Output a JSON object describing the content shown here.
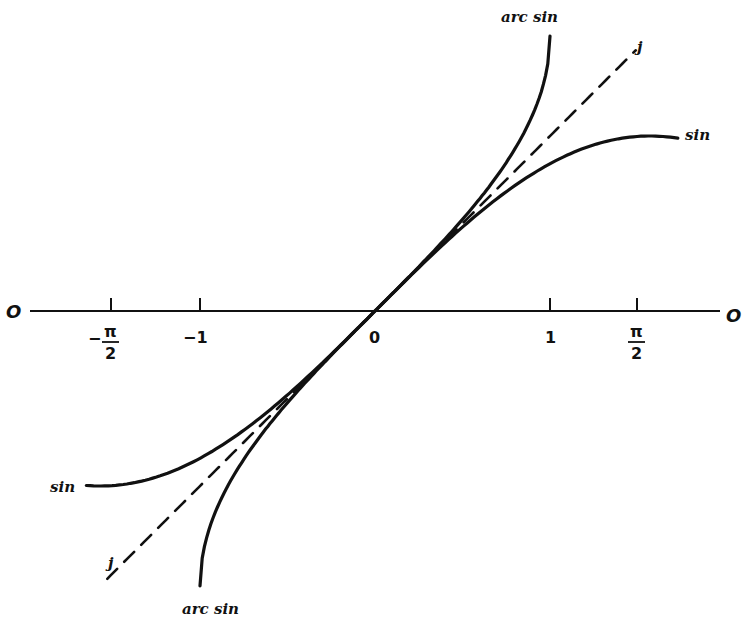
{
  "chart_data": {
    "type": "line",
    "title": "",
    "xlabel": "",
    "ylabel": "",
    "axis": {
      "left_label": "O",
      "right_label": "O",
      "origin_label": "0"
    },
    "ticks": [
      {
        "value": -1.5708,
        "label": "-π/2"
      },
      {
        "value": -1,
        "label": "-1"
      },
      {
        "value": 0,
        "label": "0"
      },
      {
        "value": 1,
        "label": "1"
      },
      {
        "value": 1.5708,
        "label": "π/2"
      }
    ],
    "xlim": [
      -2.0,
      1.96
    ],
    "grid": false,
    "legend": "inline labels at curve ends",
    "series": [
      {
        "name": "sin",
        "style": "solid",
        "function": "y = sin(x)",
        "x_range": [
          -1.65,
          1.73
        ],
        "points": [
          [
            -1.65,
            -0.997
          ],
          [
            -1.2,
            -0.932
          ],
          [
            -0.8,
            -0.717
          ],
          [
            -0.4,
            -0.389
          ],
          [
            0,
            0
          ],
          [
            0.4,
            0.389
          ],
          [
            0.8,
            0.717
          ],
          [
            1.2,
            0.932
          ],
          [
            1.73,
            0.987
          ]
        ]
      },
      {
        "name": "arc sin",
        "style": "solid",
        "function": "y = arcsin(x)",
        "x_range": [
          -1,
          1
        ],
        "points": [
          [
            -1,
            -1.571
          ],
          [
            -0.9,
            -1.12
          ],
          [
            -0.6,
            -0.644
          ],
          [
            -0.3,
            -0.305
          ],
          [
            0,
            0
          ],
          [
            0.3,
            0.305
          ],
          [
            0.6,
            0.644
          ],
          [
            0.9,
            1.12
          ],
          [
            1,
            1.571
          ]
        ]
      },
      {
        "name": "j",
        "style": "dashed",
        "function": "y = x",
        "x_range": [
          -1.53,
          1.49
        ],
        "points": [
          [
            -1.53,
            -1.53
          ],
          [
            0,
            0
          ],
          [
            1.49,
            1.49
          ]
        ]
      }
    ]
  },
  "labels": {
    "sin_upper": "sin",
    "sin_lower": "sin",
    "arcsin_upper": "arc sin",
    "arcsin_lower": "arc sin",
    "j_upper": "j",
    "j_lower": "j",
    "axis_left": "O",
    "axis_right": "O",
    "tick_neg_half_pi_sign": "−",
    "tick_pi": "π",
    "tick_two": "2",
    "tick_neg_one": "−1",
    "tick_zero": "0",
    "tick_one": "1"
  },
  "colors": {
    "ink": "#111111",
    "background": "#ffffff"
  }
}
